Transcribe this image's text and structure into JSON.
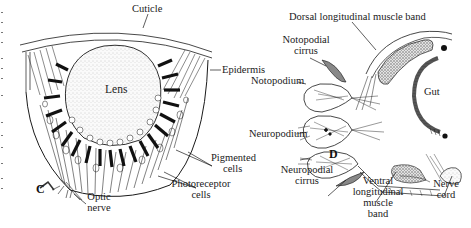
{
  "figure": {
    "panels": [
      {
        "id": "C",
        "subject": "eye cross-section",
        "labels": {
          "cuticle": "Cuticle",
          "epidermis": "Epidermis",
          "lens": "Lens",
          "pigmented_cells_1": "Pigmented",
          "pigmented_cells_2": "cells",
          "photoreceptor_cells_1": "Photoreceptor",
          "photoreceptor_cells_2": "cells",
          "optic_nerve_1": "Optic",
          "optic_nerve_2": "nerve"
        }
      },
      {
        "id": "D",
        "subject": "segment cross-section with parapodia",
        "labels": {
          "dorsal_muscle": "Dorsal longitudinal muscle band",
          "notopodial_cirrus_1": "Notopodial",
          "notopodial_cirrus_2": "cirrus",
          "notopodium": "Notopodium",
          "gut": "Gut",
          "neuropodium": "Neuropodium",
          "neuropodial_cirrus_1": "Neuropodial",
          "neuropodial_cirrus_2": "cirrus",
          "ventral_muscle_1": "Ventral",
          "ventral_muscle_2": "longitudinal",
          "ventral_muscle_3": "muscle",
          "ventral_muscle_4": "band",
          "nerve_cord_1": "Nerve",
          "nerve_cord_2": "cord"
        }
      }
    ],
    "colors": {
      "ink": "#1a1a1a",
      "background": "#ffffff",
      "stipple": "#cfcfcf"
    }
  }
}
